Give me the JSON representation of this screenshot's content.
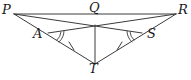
{
  "figure": {
    "background_color": "#ffffff",
    "stroke_color": "#3c3c3c",
    "label_color": "#1a1a1a",
    "width": 191,
    "height": 80
  },
  "points": {
    "P": {
      "label": "P",
      "x": 14,
      "y": 14,
      "label_x": 2,
      "label_y": 3
    },
    "Q": {
      "label": "Q",
      "x": 95,
      "y": 25,
      "label_x": 89,
      "label_y": 1
    },
    "R": {
      "label": "R",
      "x": 176,
      "y": 14,
      "label_x": 178,
      "label_y": 3
    },
    "A": {
      "label": "A",
      "x": 50,
      "y": 34,
      "label_x": 33,
      "label_y": 27
    },
    "S": {
      "label": "S",
      "x": 140,
      "y": 34,
      "label_x": 147,
      "label_y": 27
    },
    "T": {
      "label": "T",
      "x": 95,
      "y": 64,
      "label_x": 89,
      "label_y": 62
    }
  },
  "segments": [
    {
      "name": "P-R",
      "from": "P",
      "to": "R"
    },
    {
      "name": "P-S",
      "from": "P",
      "to": "S"
    },
    {
      "name": "R-A",
      "from": "R",
      "to": "A"
    },
    {
      "name": "P-T",
      "from": "P",
      "to": "T"
    },
    {
      "name": "R-T",
      "from": "R",
      "to": "T"
    },
    {
      "name": "Q-T",
      "from": "Q",
      "to": "T"
    }
  ],
  "tick_marks": [
    {
      "name": "tick-on-AT",
      "segment": "A-T",
      "count": 1
    },
    {
      "name": "tick-on-ST",
      "segment": "S-T",
      "count": 1
    }
  ],
  "angle_marks": [
    {
      "name": "angle-at-A",
      "vertex": "A"
    },
    {
      "name": "angle-at-S",
      "vertex": "S"
    }
  ],
  "vertex_order": [
    "P",
    "Q",
    "R",
    "A",
    "S",
    "T"
  ]
}
